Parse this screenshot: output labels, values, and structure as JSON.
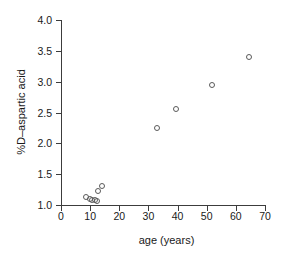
{
  "chart_data": {
    "type": "scatter",
    "title": "",
    "xlabel": "age (years)",
    "ylabel": "%D–aspartic acid",
    "xlim": [
      0,
      70
    ],
    "ylim": [
      1.0,
      4.0
    ],
    "xticks": [
      0,
      10,
      20,
      30,
      40,
      50,
      60,
      70
    ],
    "xtick_labels": [
      "0",
      "10",
      "20",
      "30",
      "40",
      "50",
      "60",
      "70"
    ],
    "yticks": [
      1.0,
      1.5,
      2.0,
      2.5,
      3.0,
      3.5,
      4.0
    ],
    "ytick_labels": [
      "1.0",
      "1.5",
      "2.0",
      "2.5",
      "3.0",
      "3.5",
      "4.0"
    ],
    "grid": false,
    "legend": false,
    "marker": "open-circle",
    "marker_color": "#5a5a5a",
    "series": [
      {
        "name": "samples",
        "points": [
          {
            "x": 8.6,
            "y": 1.13
          },
          {
            "x": 9.8,
            "y": 1.09
          },
          {
            "x": 10.6,
            "y": 1.08
          },
          {
            "x": 11.5,
            "y": 1.08
          },
          {
            "x": 12.4,
            "y": 1.07
          },
          {
            "x": 12.8,
            "y": 1.22
          },
          {
            "x": 13.9,
            "y": 1.31
          },
          {
            "x": 33.0,
            "y": 2.25
          },
          {
            "x": 39.3,
            "y": 2.55
          },
          {
            "x": 51.7,
            "y": 2.94
          },
          {
            "x": 64.5,
            "y": 3.4
          }
        ]
      }
    ]
  },
  "axes": {
    "x_title": "age (years)",
    "y_title": "%D–aspartic acid"
  },
  "colors": {
    "axis": "#3c3c3c",
    "marker": "#5a5a5a",
    "text": "#1a1a1a",
    "background": "#ffffff"
  }
}
